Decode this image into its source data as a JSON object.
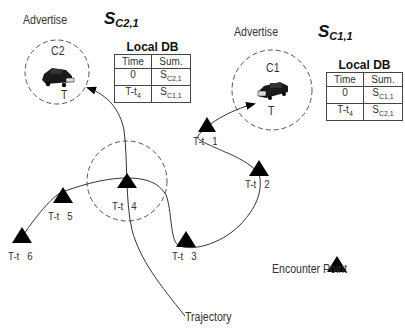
{
  "diagram": {
    "left_node": {
      "advertise_label": "Advertise",
      "summary_symbol": "S",
      "summary_sub": "C2,1",
      "car_label": "C2",
      "time_label": "T",
      "db": {
        "title": "Local DB",
        "headers": [
          "Time",
          "Sum."
        ],
        "rows": [
          {
            "time": "0",
            "time_sub": "",
            "sum": "S",
            "sum_sub": "C2,1"
          },
          {
            "time": "T-t",
            "time_sub": "4",
            "sum": "S",
            "sum_sub": "C1,1"
          }
        ]
      }
    },
    "right_node": {
      "advertise_label": "Advertise",
      "summary_symbol": "S",
      "summary_sub": "C1,1",
      "car_label": "C1",
      "time_label": "T",
      "db": {
        "title": "Local DB",
        "headers": [
          "Time",
          "Sum."
        ],
        "rows": [
          {
            "time": "0",
            "time_sub": "",
            "sum": "S",
            "sum_sub": "C1,1"
          },
          {
            "time": "T-t",
            "time_sub": "4",
            "sum": "S",
            "sum_sub": "C2,1"
          }
        ]
      }
    },
    "encounter_points": [
      {
        "label": "T-t   1"
      },
      {
        "label": "T-t   2"
      },
      {
        "label": "T-t   3"
      },
      {
        "label": "T-t   4"
      },
      {
        "label": "T-t   5"
      },
      {
        "label": "T-t   6"
      }
    ],
    "legend": {
      "encounter_point": "Encounter Point",
      "trajectory": "Trajectory"
    },
    "colors": {
      "line": "#333333",
      "triangle": "#000000",
      "dashed_circle": "#555555"
    }
  }
}
